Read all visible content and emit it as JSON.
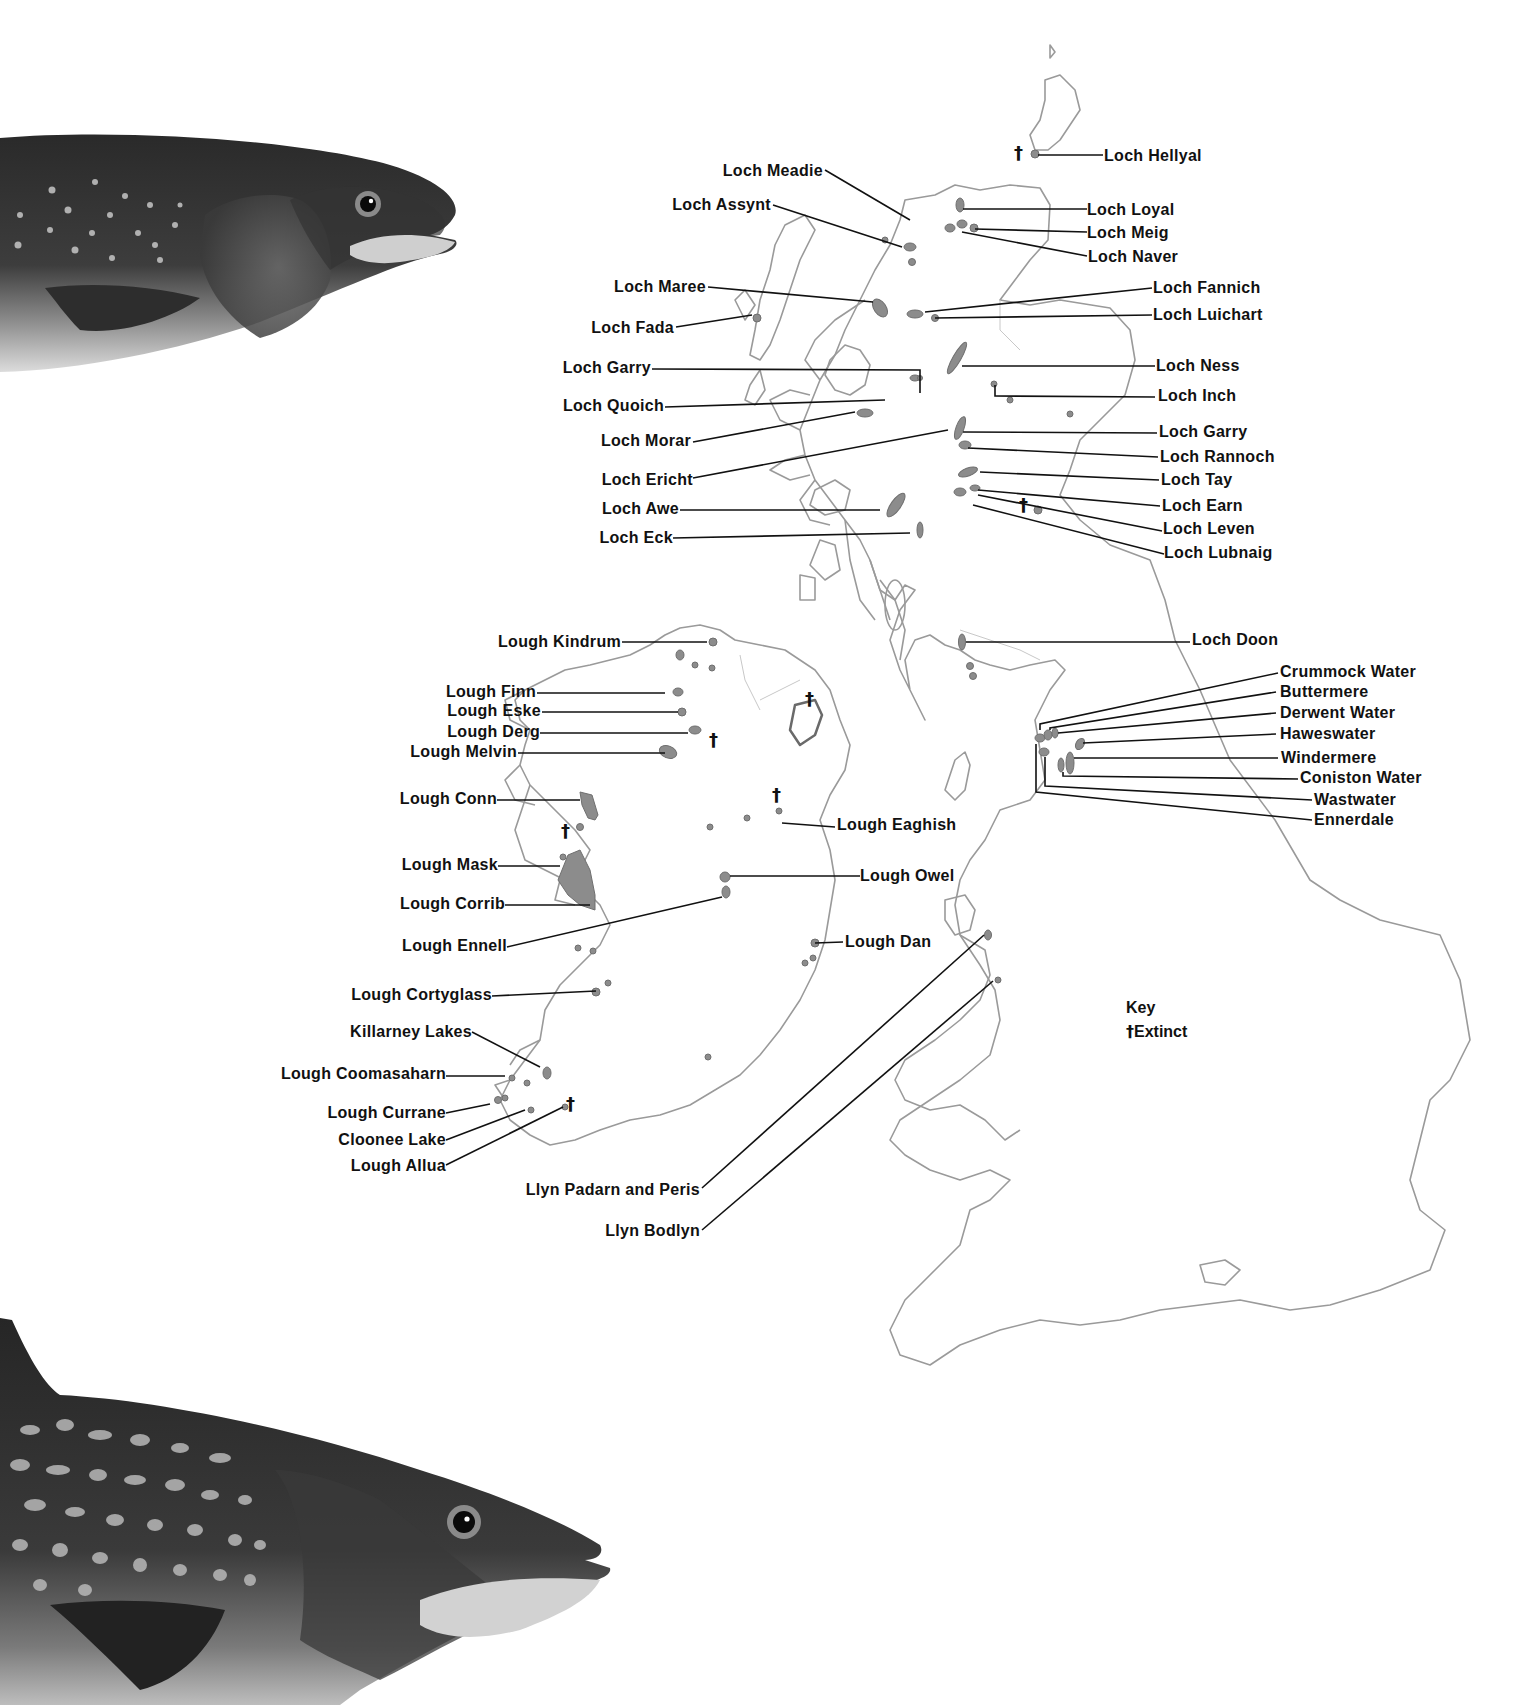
{
  "map": {
    "title": "Char lakes of Britain and Ireland",
    "key": {
      "heading": "Key",
      "extinct_symbol": "†",
      "extinct_label": "Extinct"
    },
    "colors": {
      "coast": "#9a9a9a",
      "lake": "#8c8c8c",
      "line": "#111111",
      "text": "#111111",
      "background": "#ffffff"
    },
    "labels": {
      "loch_hellyal": "Loch Hellyal",
      "loch_meadie": "Loch Meadie",
      "loch_assynt": "Loch Assynt",
      "loch_loyal": "Loch Loyal",
      "loch_meig": "Loch Meig",
      "loch_naver": "Loch Naver",
      "loch_maree": "Loch Maree",
      "loch_fada": "Loch Fada",
      "loch_fannich": "Loch Fannich",
      "loch_luichart": "Loch Luichart",
      "loch_garry_w": "Loch Garry",
      "loch_quoich": "Loch Quoich",
      "loch_morar": "Loch Morar",
      "loch_ericht": "Loch Ericht",
      "loch_awe": "Loch Awe",
      "loch_eck": "Loch Eck",
      "loch_ness": "Loch Ness",
      "loch_inch": "Loch Inch",
      "loch_garry_e": "Loch Garry",
      "loch_rannoch": "Loch Rannoch",
      "loch_tay": "Loch Tay",
      "loch_earn": "Loch Earn",
      "loch_leven": "Loch Leven",
      "loch_lubnaig": "Loch Lubnaig",
      "loch_doon": "Loch Doon",
      "crummock_water": "Crummock Water",
      "buttermere": "Buttermere",
      "derwent_water": "Derwent Water",
      "haweswater": "Haweswater",
      "windermere": "Windermere",
      "coniston_water": "Coniston Water",
      "wastwater": "Wastwater",
      "ennerdale": "Ennerdale",
      "lough_kindrum": "Lough Kindrum",
      "lough_finn": "Lough Finn",
      "lough_eske": "Lough Eske",
      "lough_derg": "Lough Derg",
      "lough_melvin": "Lough Melvin",
      "lough_conn": "Lough Conn",
      "lough_mask": "Lough Mask",
      "lough_corrib": "Lough Corrib",
      "lough_ennell": "Lough Ennell",
      "lough_cortyglass": "Lough Cortyglass",
      "killarney_lakes": "Killarney Lakes",
      "lough_coomasaharn": "Lough Coomasaharn",
      "lough_currane": "Lough Currane",
      "cloonee_lake": "Cloonee Lake",
      "lough_allua": "Lough Allua",
      "lough_eaghish": "Lough Eaghish",
      "lough_owel": "Lough Owel",
      "lough_dan": "Lough Dan",
      "llyn_padarn_peris": "Llyn Padarn and Peris",
      "llyn_bodlyn": "Llyn Bodlyn"
    },
    "extinct_marks": [
      "†",
      "†",
      "†",
      "†",
      "†",
      "†",
      "†"
    ]
  },
  "illustrations": {
    "top_fish": "char-head-spotted",
    "bottom_fish": "char-head-marbled"
  }
}
